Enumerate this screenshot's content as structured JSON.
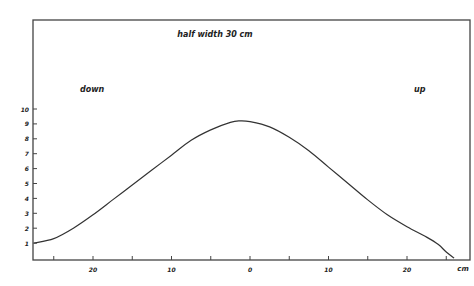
{
  "chart_data": {
    "type": "line",
    "title": "half width  30 cm",
    "annotations": [
      {
        "text": "down",
        "position": "upper-left"
      },
      {
        "text": "up",
        "position": "upper-right"
      }
    ],
    "xlabel": "cm",
    "ylabel": "",
    "x_tick_labels": [
      "20",
      "10",
      "0",
      "10",
      "20"
    ],
    "x_tick_values": [
      -20,
      -10,
      0,
      10,
      20
    ],
    "y_tick_labels": [
      "1",
      "2",
      "3",
      "4",
      "5",
      "6",
      "7",
      "8",
      "9",
      "10"
    ],
    "y_tick_values": [
      1,
      2,
      3,
      4,
      5,
      6,
      7,
      8,
      9,
      10
    ],
    "xlim": [
      -27.5,
      28
    ],
    "ylim": [
      0,
      11
    ],
    "grid": false,
    "legend": null,
    "series": [
      {
        "name": "profile",
        "x": [
          -27.5,
          -25,
          -22.5,
          -20,
          -17.5,
          -15,
          -12.5,
          -10,
          -7.5,
          -5,
          -2.5,
          -1.3,
          0,
          2.5,
          5,
          7.5,
          10,
          12.5,
          15,
          17.5,
          20,
          22.5,
          24,
          25,
          26
        ],
        "y": [
          1.0,
          1.3,
          2.0,
          2.9,
          3.9,
          4.9,
          5.9,
          6.9,
          7.9,
          8.6,
          9.1,
          9.2,
          9.15,
          8.8,
          8.1,
          7.2,
          6.1,
          5.0,
          3.9,
          2.9,
          2.1,
          1.4,
          0.9,
          0.4,
          0.0
        ]
      }
    ],
    "colors": {
      "line": "#333333",
      "frame": "#444444",
      "background": "#ffffff"
    }
  }
}
